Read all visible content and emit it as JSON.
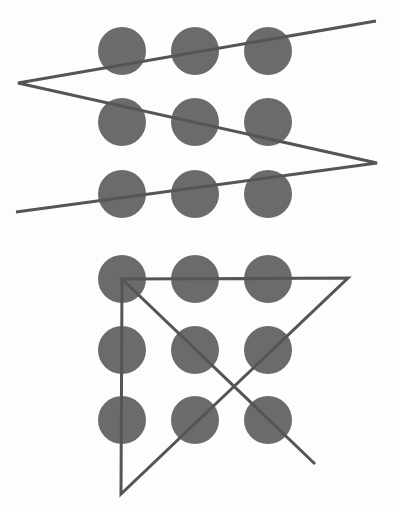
{
  "colors": {
    "background": "#fdfdfd",
    "dot": "#6b6b6b",
    "line": "#555555"
  },
  "puzzles": [
    {
      "name": "zigzag-solution",
      "grid": {
        "columns_x": [
          122,
          195,
          268
        ],
        "rows_y": [
          51,
          122,
          194
        ],
        "radius": 24
      },
      "path": [
        [
          376,
          21
        ],
        [
          18,
          83
        ],
        [
          377,
          163
        ],
        [
          16,
          212
        ]
      ]
    },
    {
      "name": "triangle-solution",
      "grid": {
        "columns_x": [
          122,
          195,
          268
        ],
        "rows_y": [
          279,
          350,
          420
        ],
        "radius": 24
      },
      "path": [
        [
          315,
          464
        ],
        [
          122,
          279
        ],
        [
          348,
          278
        ],
        [
          121,
          494
        ],
        [
          122,
          279
        ]
      ]
    }
  ]
}
